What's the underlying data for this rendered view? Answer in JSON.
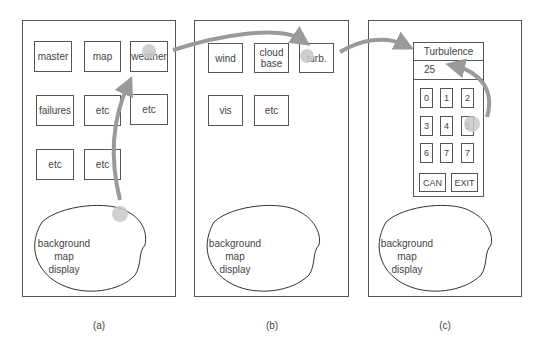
{
  "panels": [
    {
      "id": "a",
      "caption": "(a)",
      "buttons": [
        {
          "label": "master"
        },
        {
          "label": "map"
        },
        {
          "label": "weather"
        },
        {
          "label": "failures"
        },
        {
          "label": "etc"
        },
        {
          "label": "etc"
        },
        {
          "label": "etc"
        },
        {
          "label": "etc"
        }
      ],
      "map_label": [
        "background",
        "map",
        "display"
      ]
    },
    {
      "id": "b",
      "caption": "(b)",
      "buttons": [
        {
          "label": "wind"
        },
        {
          "label": "cloud base"
        },
        {
          "label": "turb."
        },
        {
          "label": "vis"
        },
        {
          "label": "etc"
        }
      ],
      "map_label": [
        "background",
        "map",
        "display"
      ]
    },
    {
      "id": "c",
      "caption": "(c)",
      "dialog": {
        "title": "Turbulence",
        "value": "25",
        "keys": [
          "0",
          "1",
          "2",
          "3",
          "4",
          "5",
          "6",
          "7",
          "7"
        ],
        "cancel_label": "CAN",
        "exit_label": "EXIT"
      },
      "map_label": [
        "background",
        "map",
        "display"
      ]
    }
  ],
  "colors": {
    "arrow": "#9a9a9a",
    "touch_point": "#c8c8c8",
    "outline": "#555555"
  }
}
